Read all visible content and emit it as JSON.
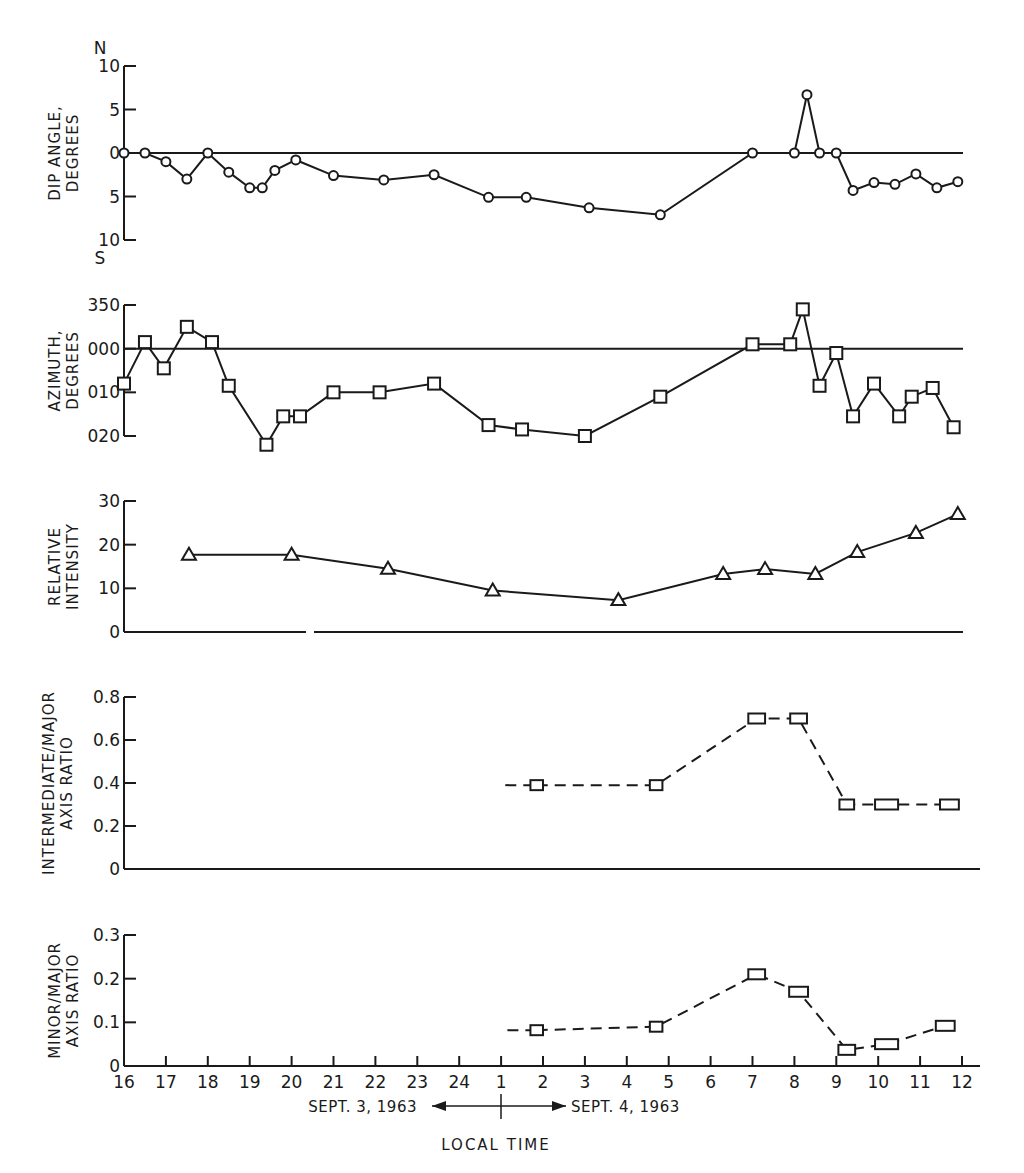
{
  "figure": {
    "x_axis": {
      "title": "LOCAL TIME",
      "tick_labels": [
        "16",
        "17",
        "18",
        "19",
        "20",
        "21",
        "22",
        "23",
        "24",
        "1",
        "2",
        "3",
        "4",
        "5",
        "6",
        "7",
        "8",
        "9",
        "10",
        "11",
        "12"
      ],
      "date_left": "SEPT. 3, 1963",
      "date_right": "SEPT. 4, 1963"
    }
  },
  "chart_data": [
    {
      "id": "dip",
      "type": "line",
      "title": "",
      "ylabel": "DIP ANGLE, DEGREES",
      "ylabel_lines": [
        "DIP ANGLE,",
        "DEGREES"
      ],
      "y_ticks": [
        {
          "v": 10,
          "label": "10"
        },
        {
          "v": 5,
          "label": "5"
        },
        {
          "v": 0,
          "label": "0"
        },
        {
          "v": -5,
          "label": "5"
        },
        {
          "v": -10,
          "label": "10"
        }
      ],
      "y_top_letter": "N",
      "y_bottom_letter": "S",
      "ylim": [
        -10,
        10
      ],
      "reference_line": 0,
      "marker": "circle",
      "line_style": "solid",
      "xlabel": "LOCAL TIME (hours since 16:00 Sept. 3, 1963)",
      "x": [
        0.0,
        0.5,
        1.0,
        1.5,
        2.0,
        2.5,
        3.0,
        3.3,
        3.6,
        4.1,
        5.0,
        6.2,
        7.4,
        8.7,
        9.6,
        11.1,
        12.8,
        15.0,
        16.0,
        16.3,
        16.6,
        17.0,
        17.4,
        17.9,
        18.4,
        18.9,
        19.4,
        19.9
      ],
      "values": [
        0,
        0,
        -1,
        -3,
        0,
        -2.2,
        -4,
        -4,
        -2,
        -0.8,
        -2.6,
        -3.1,
        -2.5,
        -5.1,
        -5.1,
        -6.3,
        -7.1,
        0,
        0,
        6.7,
        0,
        0,
        -4.3,
        -3.4,
        -3.6,
        -2.4,
        -4.0,
        -3.3
      ]
    },
    {
      "id": "azimuth",
      "type": "line",
      "ylabel": "AZIMUTH, DEGREES",
      "ylabel_lines": [
        "AZIMUTH,",
        "DEGREES"
      ],
      "y_ticks": [
        {
          "v": -10,
          "label": "350"
        },
        {
          "v": 0,
          "label": "000"
        },
        {
          "v": 10,
          "label": "010"
        },
        {
          "v": 20,
          "label": "020"
        }
      ],
      "ylim": [
        -10,
        20
      ],
      "y_inverted": true,
      "reference_line": 0,
      "marker": "square",
      "line_style": "solid",
      "note": "values are degrees east of north; negative = west of north (e.g. -5 = 355)",
      "x": [
        0.0,
        0.5,
        0.95,
        1.5,
        2.1,
        2.5,
        3.4,
        3.8,
        4.2,
        5.0,
        6.1,
        7.4,
        8.7,
        9.5,
        11.0,
        12.8,
        15.0,
        15.9,
        16.2,
        16.6,
        17.0,
        17.4,
        17.9,
        18.5,
        18.8,
        19.3,
        19.8
      ],
      "values": [
        8,
        -1.5,
        4.5,
        -5,
        -1.5,
        8.5,
        22,
        15.5,
        15.5,
        10,
        10,
        8,
        17.5,
        18.5,
        20,
        11,
        -1,
        -1,
        -9,
        8.5,
        1,
        15.5,
        8,
        15.5,
        11,
        9,
        18
      ]
    },
    {
      "id": "intensity",
      "type": "line",
      "ylabel": "RELATIVE INTENSITY",
      "ylabel_lines": [
        "RELATIVE",
        "INTENSITY"
      ],
      "y_ticks": [
        {
          "v": 30,
          "label": "30"
        },
        {
          "v": 20,
          "label": "20"
        },
        {
          "v": 10,
          "label": "10"
        },
        {
          "v": 0,
          "label": "0"
        }
      ],
      "ylim": [
        0,
        30
      ],
      "marker": "triangle",
      "line_style": "solid",
      "x": [
        1.55,
        4.0,
        6.3,
        8.8,
        11.8,
        14.3,
        15.3,
        16.5,
        17.5,
        18.9,
        19.9
      ],
      "values": [
        17.7,
        17.7,
        14.5,
        9.5,
        7.3,
        13.3,
        14.4,
        13.3,
        18.3,
        22.7,
        27
      ]
    },
    {
      "id": "intermediate_major",
      "type": "line",
      "ylabel": "INTERMEDIATE/MAJOR AXIS RATIO",
      "ylabel_lines": [
        "INTERMEDIATE/MAJOR",
        "AXIS RATIO"
      ],
      "y_ticks": [
        {
          "v": 0.8,
          "label": "0.8"
        },
        {
          "v": 0.6,
          "label": "0.6"
        },
        {
          "v": 0.4,
          "label": "0.4"
        },
        {
          "v": 0.2,
          "label": "0.2"
        },
        {
          "v": 0,
          "label": "0"
        }
      ],
      "ylim": [
        0,
        0.8
      ],
      "marker": "rectangle",
      "line_style": "dashed",
      "segments": [
        [
          9.1,
          9.8
        ],
        [
          18.9,
          19.7
        ]
      ],
      "x": [
        9.85,
        12.7,
        15.1,
        16.1,
        17.25,
        18.2,
        19.7
      ],
      "values": [
        0.39,
        0.39,
        0.7,
        0.7,
        0.3,
        0.3,
        0.3
      ],
      "marker_width_hours": [
        0.3,
        0.3,
        0.4,
        0.4,
        0.35,
        0.55,
        0.45
      ]
    },
    {
      "id": "minor_major",
      "type": "line",
      "ylabel": "MINOR/MAJOR AXIS RATIO",
      "ylabel_lines": [
        "MINOR/MAJOR",
        "AXIS RATIO"
      ],
      "y_ticks": [
        {
          "v": 0.3,
          "label": "0.3"
        },
        {
          "v": 0.2,
          "label": "0.2"
        },
        {
          "v": 0.1,
          "label": "0.1"
        },
        {
          "v": 0,
          "label": "0"
        }
      ],
      "ylim": [
        0,
        0.3
      ],
      "marker": "rectangle",
      "line_style": "dashed",
      "lead_in": 9.15,
      "x": [
        9.85,
        12.7,
        15.1,
        16.1,
        17.25,
        18.2,
        19.6
      ],
      "values": [
        0.082,
        0.09,
        0.21,
        0.17,
        0.037,
        0.05,
        0.092
      ],
      "marker_width_hours": [
        0.3,
        0.3,
        0.4,
        0.45,
        0.4,
        0.55,
        0.45
      ]
    }
  ]
}
